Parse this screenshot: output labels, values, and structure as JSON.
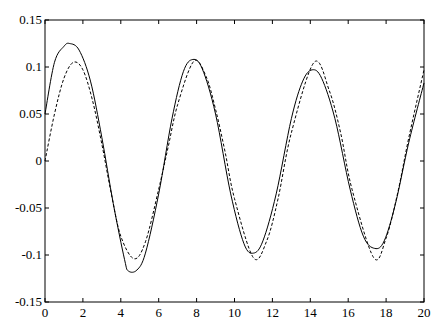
{
  "chart_data": {
    "type": "line",
    "title": "",
    "xlabel": "",
    "ylabel": "",
    "xlim": [
      0,
      20
    ],
    "ylim": [
      -0.15,
      0.15
    ],
    "grid": false,
    "legend": null,
    "xticks": [
      0,
      2,
      4,
      6,
      8,
      10,
      12,
      14,
      16,
      18,
      20
    ],
    "xtick_labels": [
      "0",
      "2",
      "4",
      "6",
      "8",
      "10",
      "12",
      "14",
      "16",
      "18",
      "20"
    ],
    "yticks": [
      -0.15,
      -0.1,
      -0.05,
      0,
      0.05,
      0.1,
      0.15
    ],
    "ytick_labels": [
      "-0.15",
      "-0.1",
      "-0.05",
      "0",
      "0.05",
      "0.1",
      "0.15"
    ],
    "series": [
      {
        "name": "solid",
        "style": "solid",
        "color": "#000000",
        "x": [
          0,
          0.5,
          1.0,
          1.3,
          1.8,
          2.4,
          3.0,
          3.6,
          4.2,
          4.4,
          4.85,
          5.3,
          6.0,
          6.7,
          7.3,
          7.8,
          8.3,
          9.0,
          9.8,
          10.5,
          11.0,
          11.5,
          12.2,
          13.0,
          13.6,
          14.1,
          14.6,
          15.3,
          16.1,
          16.8,
          17.4,
          17.9,
          18.5,
          19.2,
          20.0
        ],
        "y": [
          0.05,
          0.105,
          0.122,
          0.125,
          0.118,
          0.085,
          0.025,
          -0.045,
          -0.105,
          -0.117,
          -0.116,
          -0.098,
          -0.035,
          0.045,
          0.095,
          0.108,
          0.098,
          0.05,
          -0.035,
          -0.088,
          -0.098,
          -0.085,
          -0.035,
          0.045,
          0.085,
          0.097,
          0.088,
          0.045,
          -0.03,
          -0.08,
          -0.093,
          -0.085,
          -0.045,
          0.02,
          0.083
        ]
      },
      {
        "name": "dashed",
        "style": "dashed",
        "color": "#000000",
        "x": [
          0,
          0.5,
          1.0,
          1.5,
          2.0,
          2.5,
          3.0,
          3.5,
          4.0,
          4.7,
          5.3,
          6.0,
          6.5,
          7.0,
          7.85,
          8.5,
          9.0,
          9.5,
          10.0,
          11.0,
          11.7,
          12.3,
          13.0,
          14.2,
          15.0,
          15.6,
          16.2,
          17.35,
          18.0,
          18.6,
          19.2,
          20.0
        ],
        "y": [
          0.0,
          0.05,
          0.088,
          0.105,
          0.097,
          0.065,
          0.018,
          -0.035,
          -0.08,
          -0.104,
          -0.086,
          -0.03,
          0.015,
          0.06,
          0.106,
          0.09,
          0.055,
          0.01,
          -0.04,
          -0.103,
          -0.085,
          -0.04,
          0.03,
          0.105,
          0.075,
          0.03,
          -0.03,
          -0.103,
          -0.082,
          -0.035,
          0.025,
          0.097
        ]
      }
    ]
  }
}
